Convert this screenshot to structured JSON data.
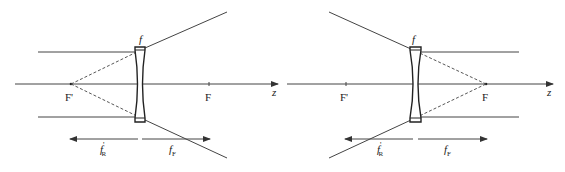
{
  "diagrams": [
    {
      "name": "left-diverging-lens",
      "axis_label": "z",
      "lens_label": "f",
      "focal_point_front": "F'",
      "focal_point_back": "F",
      "dim_left": {
        "main": "f",
        "prime": "'",
        "sub": "R"
      },
      "dim_right": {
        "main": "f",
        "sub": "F"
      }
    },
    {
      "name": "right-diverging-lens",
      "axis_label": "z",
      "lens_label": "f",
      "focal_point_front": "F'",
      "focal_point_back": "F",
      "dim_left": {
        "main": "f",
        "prime": "'",
        "sub": "R"
      },
      "dim_right": {
        "main": "f",
        "sub": "F"
      }
    }
  ],
  "colors": {
    "line": "#333333",
    "lens": "#222222",
    "background": "#ffffff"
  }
}
